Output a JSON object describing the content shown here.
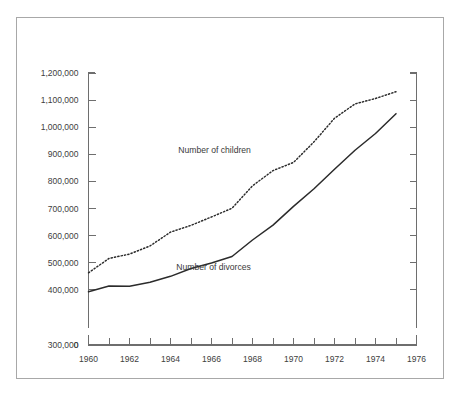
{
  "figure": {
    "background_color": "#ffffff",
    "frame_color": "#a8a8a8",
    "axis_color": "#6e6e6e",
    "line_color": "#2b2b2b"
  },
  "chart_data": {
    "type": "line",
    "title": "",
    "subtitle": "",
    "xlabel": "",
    "ylabel": "",
    "xlim": [
      1960,
      1976
    ],
    "ylim": [
      0,
      1200000
    ],
    "y_axis_break": true,
    "y_break_range": [
      0,
      300000
    ],
    "grid": false,
    "legend_position": "inline-annotation",
    "x_tick_labels": [
      "1960",
      "1962",
      "1964",
      "1966",
      "1968",
      "1970",
      "1972",
      "1974",
      "1976"
    ],
    "x_tick_values": [
      1960,
      1962,
      1964,
      1966,
      1968,
      1970,
      1972,
      1974,
      1976
    ],
    "x_minor_tick_values": [
      1961,
      1963,
      1965,
      1967,
      1969,
      1971,
      1973,
      1975
    ],
    "y_tick_labels": [
      "0",
      "300,000",
      "400,000",
      "500,000",
      "600,000",
      "700,000",
      "800,000",
      "900,000",
      "1,000,000",
      "1,100,000",
      "1,200,000"
    ],
    "y_tick_values": [
      0,
      300000,
      400000,
      500000,
      600000,
      700000,
      800000,
      900000,
      1000000,
      1100000,
      1200000
    ],
    "x": [
      1960,
      1961,
      1962,
      1963,
      1964,
      1965,
      1966,
      1967,
      1968,
      1969,
      1970,
      1971,
      1972,
      1973,
      1974,
      1975
    ],
    "series": [
      {
        "name": "Number of children",
        "style": "dotted",
        "label": "Number of children",
        "label_x": 1966.15,
        "label_y": 905000,
        "values": [
          463000,
          516000,
          532000,
          562000,
          613000,
          638000,
          669000,
          701000,
          784000,
          840000,
          870000,
          946000,
          1033000,
          1086000,
          1106000,
          1131000
        ]
      },
      {
        "name": "Number of divorces",
        "style": "solid",
        "label": "Number of divorces",
        "label_x": 1966.1,
        "label_y": 474000,
        "values": [
          393000,
          414000,
          413000,
          428000,
          450000,
          479000,
          499000,
          523000,
          584000,
          639000,
          708000,
          773000,
          845000,
          915000,
          977000,
          1050000
        ]
      }
    ]
  }
}
